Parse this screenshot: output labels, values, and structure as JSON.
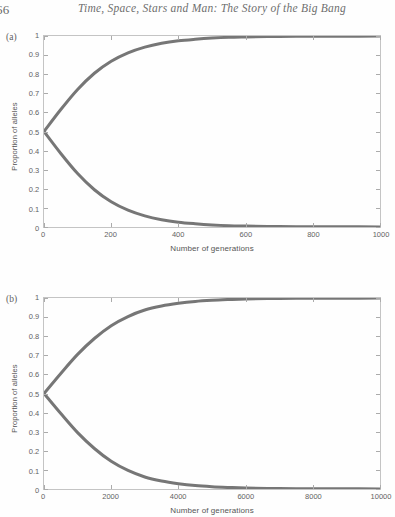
{
  "page": {
    "folio": "66",
    "running_title": "Time, Space, Stars and Man: The Story of the Big Bang"
  },
  "panels": [
    {
      "label": "(a)",
      "name": "panel-a"
    },
    {
      "label": "(b)",
      "name": "panel-b"
    }
  ],
  "chart_data": [
    {
      "type": "line",
      "panel": "(a)",
      "title": "",
      "xlabel": "Number of generations",
      "ylabel": "Proportion of alleles",
      "xlim": [
        0,
        1000
      ],
      "ylim": [
        0,
        1
      ],
      "xticks": [
        0,
        200,
        400,
        600,
        800,
        1000
      ],
      "xtick_labels": [
        "0",
        "200",
        "400",
        "600",
        "800",
        "1000"
      ],
      "yticks": [
        0,
        0.1,
        0.2,
        0.3,
        0.4,
        0.5,
        0.6,
        0.7,
        0.8,
        0.9,
        1
      ],
      "ytick_labels": [
        "0",
        "0.1",
        "0.2",
        "0.3",
        "0.4",
        "0.5",
        "0.6",
        "0.7",
        "0.8",
        "0.9",
        "1"
      ],
      "grid": false,
      "legend": "none",
      "line_color": "#5a5a5a",
      "line_width": 3,
      "series": [
        {
          "name": "fixing allele",
          "x": [
            0,
            50,
            100,
            150,
            200,
            250,
            300,
            350,
            400,
            450,
            500,
            550,
            600,
            700,
            800,
            900,
            1000
          ],
          "values": [
            0.5,
            0.615,
            0.72,
            0.805,
            0.868,
            0.912,
            0.942,
            0.962,
            0.975,
            0.983,
            0.989,
            0.993,
            0.995,
            0.998,
            0.999,
            0.999,
            1.0
          ]
        },
        {
          "name": "lost allele",
          "x": [
            0,
            50,
            100,
            150,
            200,
            250,
            300,
            350,
            400,
            450,
            500,
            550,
            600,
            700,
            800,
            900,
            1000
          ],
          "values": [
            0.5,
            0.385,
            0.28,
            0.195,
            0.132,
            0.088,
            0.058,
            0.038,
            0.025,
            0.017,
            0.011,
            0.007,
            0.005,
            0.002,
            0.001,
            0.001,
            0.0
          ]
        }
      ]
    },
    {
      "type": "line",
      "panel": "(b)",
      "title": "",
      "xlabel": "Number of generations",
      "ylabel": "Proportion of alleles",
      "xlim": [
        0,
        10000
      ],
      "ylim": [
        0,
        1
      ],
      "xticks": [
        0,
        2000,
        4000,
        6000,
        8000,
        10000
      ],
      "xtick_labels": [
        "0",
        "2000",
        "4000",
        "6000",
        "8000",
        "10000"
      ],
      "yticks": [
        0,
        0.1,
        0.2,
        0.3,
        0.4,
        0.5,
        0.6,
        0.7,
        0.8,
        0.9,
        1
      ],
      "ytick_labels": [
        "0",
        "0.1",
        "0.2",
        "0.3",
        "0.4",
        "0.5",
        "0.6",
        "0.7",
        "0.8",
        "0.9",
        "1"
      ],
      "grid": false,
      "legend": "none",
      "line_color": "#5a5a5a",
      "line_width": 3,
      "series": [
        {
          "name": "fixing allele",
          "x": [
            0,
            500,
            1000,
            1500,
            2000,
            2500,
            3000,
            3500,
            4000,
            4500,
            5000,
            5500,
            6000,
            7000,
            8000,
            9000,
            10000
          ],
          "values": [
            0.5,
            0.605,
            0.705,
            0.788,
            0.855,
            0.903,
            0.937,
            0.958,
            0.972,
            0.982,
            0.988,
            0.992,
            0.995,
            0.998,
            0.999,
            0.999,
            1.0
          ]
        },
        {
          "name": "lost allele",
          "x": [
            0,
            500,
            1000,
            1500,
            2000,
            2500,
            3000,
            3500,
            4000,
            4500,
            5000,
            5500,
            6000,
            7000,
            8000,
            9000,
            10000
          ],
          "values": [
            0.5,
            0.395,
            0.295,
            0.212,
            0.145,
            0.097,
            0.063,
            0.042,
            0.028,
            0.018,
            0.012,
            0.008,
            0.005,
            0.002,
            0.001,
            0.001,
            0.0
          ]
        }
      ]
    }
  ]
}
